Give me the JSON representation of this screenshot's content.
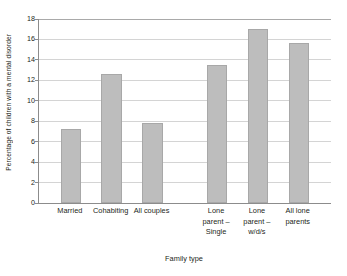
{
  "chart_data": {
    "type": "bar",
    "title": "",
    "xlabel": "Family type",
    "ylabel": "Percentage of children with a mental disorder",
    "categories": [
      "Married",
      "Cohabiting",
      "All couples",
      "Lone parent – Single",
      "Lone parent – w/d/s",
      "All lone parents"
    ],
    "category_lines": [
      [
        "Married"
      ],
      [
        "Cohabiting"
      ],
      [
        "All couples"
      ],
      [
        "Lone",
        "parent –",
        "Single"
      ],
      [
        "Lone",
        "parent –",
        "w/d/s"
      ],
      [
        "All lone",
        "parents"
      ]
    ],
    "values": [
      7.2,
      12.6,
      7.8,
      13.5,
      17.0,
      15.7
    ],
    "ylim": [
      0,
      18
    ],
    "ytick_labels": [
      "0",
      "2",
      "4",
      "6",
      "8",
      "10",
      "12",
      "14",
      "16",
      "18"
    ],
    "ytick_values": [
      0,
      2,
      4,
      6,
      8,
      10,
      12,
      14,
      16,
      18
    ],
    "grid": true,
    "legend": "none",
    "bar_color": "#bdbdbd",
    "bar_border_color": "#a8a8a8",
    "gridline_color": "#d4d4d4",
    "axis_color": "#8c8c8c",
    "text_color": "#231f20",
    "background_color": "#ffffff",
    "group_gap_after_index": 2
  }
}
